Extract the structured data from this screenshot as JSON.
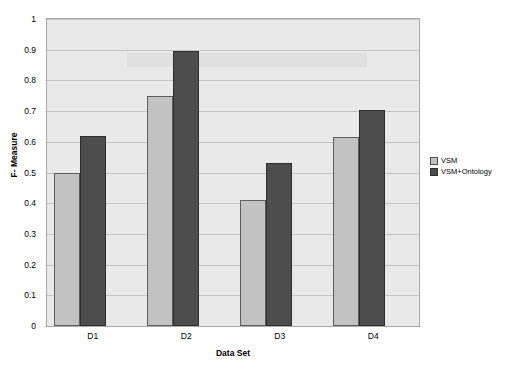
{
  "chart_data": {
    "type": "bar",
    "title": "",
    "subtitle": "",
    "xlabel": "Data Set",
    "ylabel": "F- Measure",
    "categories": [
      "D1",
      "D2",
      "D3",
      "D4"
    ],
    "series": [
      {
        "name": "VSM",
        "values": [
          0.5,
          0.75,
          0.41,
          0.615
        ],
        "color": "#c2c2c2"
      },
      {
        "name": "VSM+Ontology",
        "values": [
          0.62,
          0.895,
          0.53,
          0.705
        ],
        "color": "#4d4d4d"
      }
    ],
    "ylim": [
      0,
      1
    ],
    "ytick_labels": [
      "1",
      "0.9",
      "0.8",
      "0.7",
      "0.6",
      "0.5",
      "0.4",
      "0.3",
      "0.2",
      "0.1",
      "0"
    ],
    "ytick_values": [
      1,
      0.9,
      0.8,
      0.7,
      0.6,
      0.5,
      0.4,
      0.3,
      0.2,
      0.1,
      0
    ],
    "grid": true,
    "grid_axis": "y",
    "legend_position": "right",
    "plot_background": "#e9e9e9"
  },
  "legend": {
    "entries": [
      {
        "label": "VSM"
      },
      {
        "label": "VSM+Ontology"
      }
    ]
  },
  "axes": {
    "x_title": "Data Set",
    "y_title": "F- Measure"
  }
}
